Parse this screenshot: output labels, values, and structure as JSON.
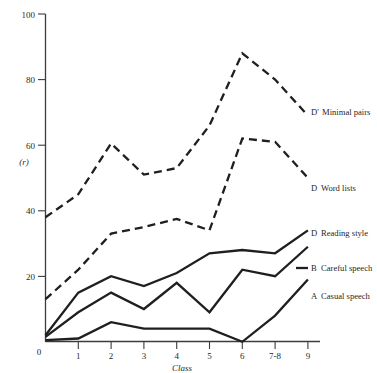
{
  "chart_data": {
    "type": "line",
    "title": "",
    "subtitle": "",
    "xlabel": "Class",
    "ylabel": "(r)",
    "x": [
      0,
      1,
      2,
      3,
      4,
      5,
      6,
      7,
      9
    ],
    "categories": [
      "0",
      "1",
      "2",
      "3",
      "4",
      "5",
      "6",
      "7-8",
      "9"
    ],
    "xtick_labels": [
      "0",
      "1",
      "2",
      "3",
      "4",
      "5",
      "6",
      "7-8",
      "9"
    ],
    "ytick_labels": [
      "0",
      "20",
      "40",
      "60",
      "80",
      "100"
    ],
    "ytick_values": [
      0,
      20,
      40,
      60,
      80,
      100
    ],
    "ylim": [
      0,
      100
    ],
    "grid": false,
    "legend_position": "right-inline",
    "series": [
      {
        "name": "D' Minimal pairs",
        "code": "D'",
        "label": "Minimal pairs",
        "style": "dashed",
        "values": [
          38,
          45,
          60.5,
          51,
          53,
          66,
          88,
          80,
          69
        ]
      },
      {
        "name": "D Word lists",
        "code": "D",
        "label": "Word lists",
        "style": "dashed",
        "values": [
          13,
          22,
          33,
          35,
          37.5,
          34,
          62,
          61,
          50
        ]
      },
      {
        "name": "D Reading style",
        "code": "D",
        "label": "Reading style",
        "style": "solid",
        "values": [
          2,
          15,
          20,
          17,
          21,
          27,
          28,
          27,
          34
        ]
      },
      {
        "name": "B Careful speech",
        "code": "B",
        "label": "Careful speech",
        "style": "solid",
        "values": [
          1.5,
          9,
          15,
          10,
          18,
          9,
          22,
          20,
          29
        ]
      },
      {
        "name": "A Casual speech",
        "code": "A",
        "label": "Casual speech",
        "style": "solid",
        "values": [
          0.5,
          1,
          6,
          4,
          4,
          4,
          0,
          8,
          19
        ]
      }
    ],
    "series_labels": [
      {
        "code": "D'",
        "text": "Minimal pairs"
      },
      {
        "code": "D",
        "text": "Word lists"
      },
      {
        "code": "D",
        "text": "Reading style"
      },
      {
        "code": "B",
        "text": "Careful speech"
      },
      {
        "code": "A",
        "text": "Casual speech"
      }
    ]
  }
}
